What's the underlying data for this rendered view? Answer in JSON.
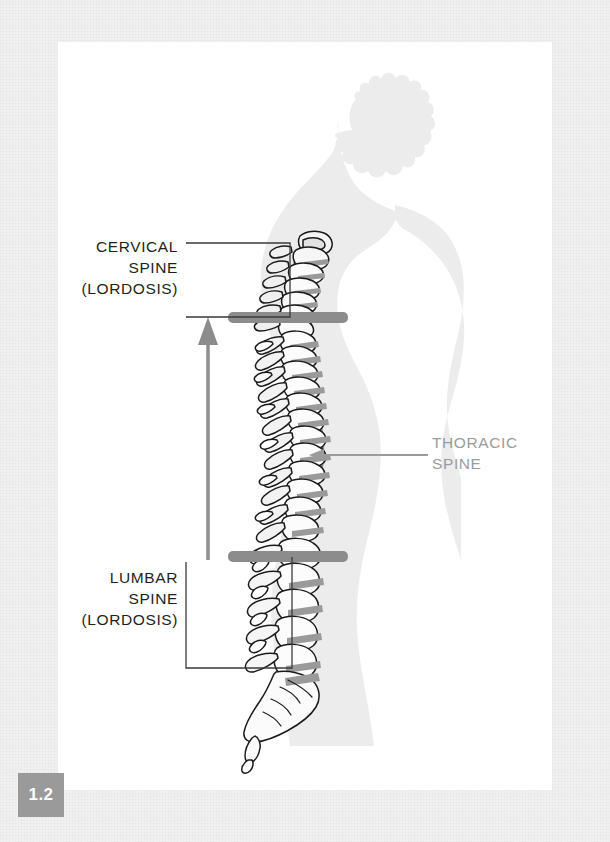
{
  "figure": {
    "number": "1.2"
  },
  "labels": {
    "cervical": "CERVICAL\nSPINE\n(LORDOSIS)",
    "lumbar": "LUMBAR\nSPINE\n(LORDOSIS)",
    "thoracic": "THORACIC\nSPINE"
  },
  "icons": {
    "up_arrow": "up-arrow-icon",
    "left_arrow": "left-arrow-icon",
    "body_silhouette": "human-profile-silhouette-icon",
    "spine": "vertebral-column-icon"
  },
  "colors": {
    "page_background": "#ffffff",
    "frame": "#f1f1f1",
    "silhouette": "#ececec",
    "marker_bar": "#8c8c8c",
    "arrow": "#8c8c8c",
    "leader_line": "#9b9b9b",
    "label_text": "#231f20",
    "thoracic_text": "#9b9b9b",
    "badge_background": "#9a9a9a",
    "badge_text": "#ffffff",
    "bone_outline": "#1a1a1a",
    "bone_fill": "#fdfdfd",
    "bone_shadow": "#8f8f8f",
    "curve_line": "#8a8a8a"
  },
  "markers": {
    "cervicothoracic_junction_y": 317,
    "thoracolumbar_junction_y": 557,
    "arrow_x": 208
  }
}
